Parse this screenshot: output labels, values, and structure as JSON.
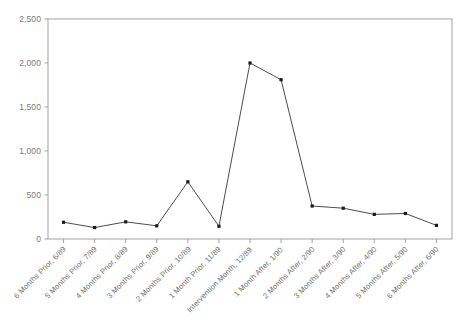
{
  "chart_data": {
    "type": "line",
    "title": "",
    "subtitle": "",
    "xlabel": "",
    "ylabel": "",
    "ylim": [
      0,
      2500
    ],
    "yticks": [
      0,
      500,
      1000,
      1500,
      2000,
      2500
    ],
    "ytick_labels": [
      "0",
      "500",
      "1,000",
      "1,500",
      "2,000",
      "2,500"
    ],
    "grid": false,
    "legend": "none",
    "marker": "filled-square",
    "line_color": "#4d4d4d",
    "marker_color": "#1a1a1a",
    "axis_color": "#9a9a9a",
    "categories": [
      "6 Months Prior, 6/89",
      "5 Months Prior, 7/89",
      "4 Months Prior, 8/89",
      "3 Months Prior, 9/89",
      "2 Months Prior, 10/89",
      "1 Month Prior, 11/89",
      "Intervention Month, 12/89",
      "1 Month After, 1/90",
      "2 Months After, 2/90",
      "3 Months After, 3/90",
      "4 Months After, 4/90",
      "5 Months After, 5/90",
      "6 Months After, 6/90"
    ],
    "values": [
      190,
      130,
      195,
      150,
      650,
      145,
      2000,
      1810,
      375,
      350,
      280,
      290,
      155
    ]
  }
}
